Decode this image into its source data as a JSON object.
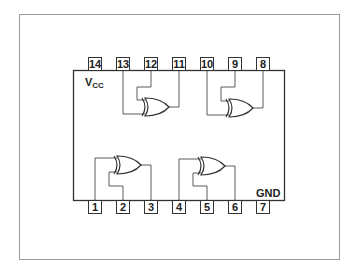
{
  "diagram": {
    "type": "ic-pinout",
    "labels": {
      "vcc_main": "V",
      "vcc_sub": "CC",
      "gnd": "GND"
    },
    "top_pins": [
      "14",
      "13",
      "12",
      "11",
      "10",
      "9",
      "8"
    ],
    "bottom_pins": [
      "1",
      "2",
      "3",
      "4",
      "5",
      "6",
      "7"
    ],
    "gates": [
      {
        "name": "gate-1",
        "type": "XOR",
        "inputs": [
          "1",
          "2"
        ],
        "output": "3"
      },
      {
        "name": "gate-2",
        "type": "XOR",
        "inputs": [
          "4",
          "5"
        ],
        "output": "6"
      },
      {
        "name": "gate-3",
        "type": "XOR",
        "inputs": [
          "13",
          "12"
        ],
        "output": "11"
      },
      {
        "name": "gate-4",
        "type": "XOR",
        "inputs": [
          "10",
          "9"
        ],
        "output": "8"
      }
    ],
    "power": {
      "vcc_pin": "14",
      "gnd_pin": "7"
    },
    "colors": {
      "line": "#333333",
      "frame": "#888888",
      "background": "#ffffff"
    }
  }
}
